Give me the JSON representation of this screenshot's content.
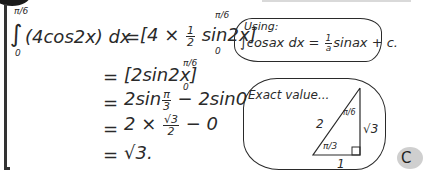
{
  "worked_solution": {
    "integral": {
      "upper_limit": "π/6",
      "lower_limit": "0",
      "integrand": "(4cos2x) dx",
      "sign": "∫"
    },
    "lines": [
      {
        "eq": "=",
        "expr_before": "[4 × ",
        "frac_num": "1",
        "frac_den": "2",
        "expr_after": " sin2x]",
        "upper": "π/6",
        "lower": "0"
      },
      {
        "eq": "=",
        "expr": "[2sin2x]",
        "upper": "π/6",
        "lower": "0"
      },
      {
        "eq": "=",
        "expr_before": "2sin",
        "frac_num": "π",
        "frac_den": "3",
        "expr_after": " − 2sin0"
      },
      {
        "eq": "=",
        "expr_before": "2 × ",
        "frac_num": "√3",
        "frac_den": "2",
        "expr_after": " − 0"
      },
      {
        "eq": "=",
        "expr": "√3."
      }
    ]
  },
  "hint_using": {
    "title": "Using:",
    "formula_before": "∫cosax dx = ",
    "frac_num": "1",
    "frac_den": "a",
    "formula_after": "sinax + c."
  },
  "hint_exact_value": {
    "title": "Exact value...",
    "triangle": {
      "hypotenuse": "2",
      "opposite": "√3",
      "adjacent": "1",
      "top_angle": "π/6",
      "bottom_angle": "π/3"
    }
  },
  "badge": {
    "label": "C"
  }
}
